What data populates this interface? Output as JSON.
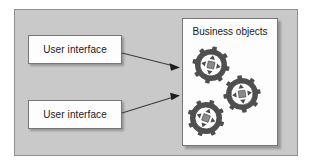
{
  "diagram": {
    "title_absent": true,
    "background_color": "#ffffff",
    "panel_color": "#c9c9c9",
    "panel_border_color": "#8e8e8e",
    "card_color": "#fdfdfd",
    "card_border_color": "#767676",
    "text_color": "#1a1a1a",
    "arrow_color": "#3a3a3a",
    "gear_ring_color": "#555555",
    "gear_inner_color": "#ffffff",
    "gear_center_color": "#8a8a8a"
  },
  "boxes": [
    {
      "id": "ui-top",
      "label": "User interface"
    },
    {
      "id": "ui-bottom",
      "label": "User interface"
    }
  ],
  "business_objects_panel": {
    "title": "Business objects",
    "objects": [
      {
        "id": "business-object-1",
        "icon": "gear-object-icon"
      },
      {
        "id": "business-object-2",
        "icon": "gear-object-icon"
      },
      {
        "id": "business-object-3",
        "icon": "gear-object-icon"
      }
    ]
  },
  "connectors": [
    {
      "id": "connector-top",
      "from": "ui-top",
      "to": "business-objects-panel",
      "style": "solid-arrow"
    },
    {
      "id": "connector-bottom",
      "from": "ui-bottom",
      "to": "business-objects-panel",
      "style": "solid-arrow"
    }
  ]
}
